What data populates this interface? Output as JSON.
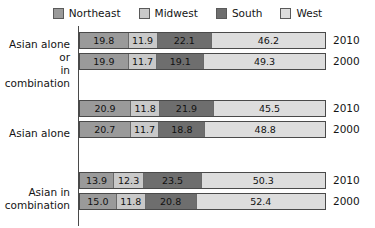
{
  "chart_data": {
    "type": "bar",
    "orientation": "horizontal",
    "stacked": true,
    "stack_total": 100,
    "title": "",
    "subtitle": "",
    "xlabel": "",
    "ylabel": "",
    "xlim": [
      0,
      100
    ],
    "grid": false,
    "legend_position": "top-center",
    "legend": [
      {
        "name": "Northeast",
        "color": "#9a9a9a"
      },
      {
        "name": "Midwest",
        "color": "#c9c9c9"
      },
      {
        "name": "South",
        "color": "#6e6e6e"
      },
      {
        "name": "West",
        "color": "#dddddd"
      }
    ],
    "categories": [
      "Northeast",
      "Midwest",
      "South",
      "West"
    ],
    "groups": [
      {
        "label_lines": [
          "Asian alone or",
          "in combination"
        ],
        "rows": [
          {
            "year": "2010",
            "values": [
              19.8,
              11.9,
              22.1,
              46.2
            ]
          },
          {
            "year": "2000",
            "values": [
              19.9,
              11.7,
              19.1,
              49.3
            ]
          }
        ]
      },
      {
        "label_lines": [
          "Asian alone"
        ],
        "rows": [
          {
            "year": "2010",
            "values": [
              20.9,
              11.8,
              21.9,
              45.5
            ]
          },
          {
            "year": "2000",
            "values": [
              20.7,
              11.7,
              18.8,
              48.8
            ]
          }
        ]
      },
      {
        "label_lines": [
          "Asian in",
          "combination"
        ],
        "rows": [
          {
            "year": "2010",
            "values": [
              13.9,
              12.3,
              23.5,
              50.3
            ]
          },
          {
            "year": "2000",
            "values": [
              15.0,
              11.8,
              20.8,
              52.4
            ]
          }
        ]
      }
    ]
  },
  "layout": {
    "group_tops": [
      8,
      76,
      148
    ],
    "row_offsets": [
      0,
      21
    ],
    "label_tops": [
      6,
      27,
      14
    ],
    "colors": {
      "axis": "#4a4a4a",
      "bar_border": "#4a4a4a",
      "text": "#141414"
    }
  }
}
